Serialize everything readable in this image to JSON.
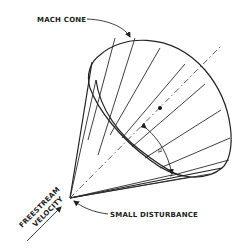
{
  "diagram": {
    "labels": {
      "mach_cone": "MACH CONE",
      "small_disturbance": "SMALL DISTURBANCE",
      "freestream_line1": "FREESTREAM",
      "freestream_line2": "VELOCITY",
      "angle_symbol": "μ"
    },
    "colors": {
      "ink": "#222222",
      "background": "#ffffff"
    }
  }
}
